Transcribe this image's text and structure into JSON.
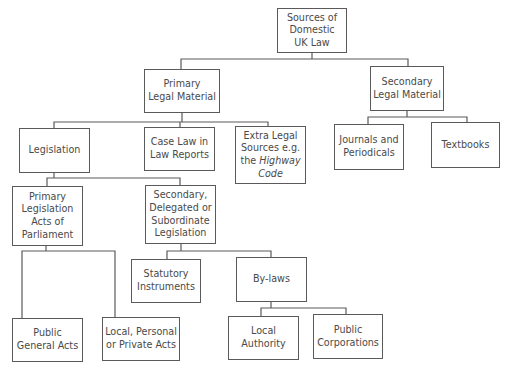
{
  "diagram": {
    "title": "Sources of Domestic UK Law",
    "colors": {
      "line": "#5a5a5a",
      "text": "#4a4a4a",
      "background": "#ffffff"
    },
    "nodes": [
      {
        "id": "root",
        "label": "Sources of\nDomestic\nUK Law",
        "x": 277,
        "y": 8,
        "w": 70,
        "h": 45
      },
      {
        "id": "primary",
        "label": "Primary\nLegal Material",
        "x": 144,
        "y": 69,
        "w": 76,
        "h": 44
      },
      {
        "id": "secondary",
        "label": "Secondary\nLegal Material",
        "x": 370,
        "y": 66,
        "w": 74,
        "h": 45
      },
      {
        "id": "legislation",
        "label": "Legislation",
        "x": 19,
        "y": 128,
        "w": 71,
        "h": 45
      },
      {
        "id": "caselaw",
        "label": "Case Law in\nLaw Reports",
        "x": 144,
        "y": 127,
        "w": 71,
        "h": 44
      },
      {
        "id": "extra",
        "label": "Extra Legal\nSources e.g.\nthe ",
        "italic": "Highway\nCode",
        "x": 235,
        "y": 126,
        "w": 71,
        "h": 58
      },
      {
        "id": "journals",
        "label": "Journals and\nPeriodicals",
        "x": 334,
        "y": 124,
        "w": 70,
        "h": 46
      },
      {
        "id": "textbooks",
        "label": "Textbooks",
        "x": 431,
        "y": 122,
        "w": 69,
        "h": 46
      },
      {
        "id": "primleg",
        "label": "Primary\nLegislation\nActs of\nParliament",
        "x": 12,
        "y": 186,
        "w": 71,
        "h": 60
      },
      {
        "id": "secleg",
        "label": "Secondary,\nDelegated or\nSubordinate\nLegislation",
        "x": 145,
        "y": 185,
        "w": 71,
        "h": 59
      },
      {
        "id": "statutory",
        "label": "Statutory\nInstruments",
        "x": 131,
        "y": 259,
        "w": 70,
        "h": 44
      },
      {
        "id": "bylaws",
        "label": "By-laws",
        "x": 236,
        "y": 257,
        "w": 71,
        "h": 45
      },
      {
        "id": "publicgen",
        "label": "Public\nGeneral Acts",
        "x": 12,
        "y": 318,
        "w": 71,
        "h": 44
      },
      {
        "id": "localpers",
        "label": "Local, Personal\nor Private Acts",
        "x": 102,
        "y": 317,
        "w": 78,
        "h": 44
      },
      {
        "id": "localauth",
        "label": "Local\nAuthority",
        "x": 228,
        "y": 316,
        "w": 71,
        "h": 44
      },
      {
        "id": "publiccorp",
        "label": "Public\nCorporations",
        "x": 313,
        "y": 314,
        "w": 70,
        "h": 45
      }
    ],
    "edges": [
      "M312 53 V59 M181 69 V59 H408 V66",
      "M182 113 V122 M54 128 V122 H268 V126 M180 122 V127",
      "M407 111 V117 M368 124 V117 H467 V122",
      "M54 173 V178 M47 186 V178 H180 V185",
      "M46 246 V251 M22 318 V251 H115 V317",
      "M181 244 V251 M167 259 V251 H271 V257",
      "M271 302 V308 M261 316 V308 H346 V314"
    ]
  }
}
